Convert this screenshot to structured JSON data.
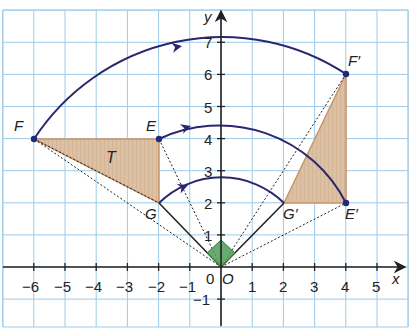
{
  "diagram": {
    "type": "rotation-figure",
    "axes": {
      "x_label": "x",
      "y_label": "y",
      "x_ticks": [
        "−6",
        "−5",
        "−4",
        "−3",
        "−2",
        "−1",
        "1",
        "2",
        "3",
        "4",
        "5"
      ],
      "y_ticks": [
        "1",
        "2",
        "3",
        "4",
        "5",
        "6",
        "7"
      ],
      "y_neg_tick": "−1",
      "origin_label": "0",
      "xlim": [
        -6.9,
        6
      ],
      "ylim": [
        -1.9,
        8.2
      ]
    },
    "points": {
      "F": {
        "label": "F",
        "x": -6,
        "y": 4
      },
      "E": {
        "label": "E",
        "x": -2,
        "y": 4
      },
      "G": {
        "label": "G",
        "x": -2,
        "y": 2
      },
      "F_prime": {
        "label": "F′",
        "x": 4,
        "y": 6
      },
      "E_prime": {
        "label": "E′",
        "x": 4,
        "y": 2
      },
      "G_prime": {
        "label": "G′",
        "x": 2,
        "y": 2
      },
      "O": {
        "label": "O",
        "x": 0,
        "y": 0
      }
    },
    "shape_label": "T",
    "colors": {
      "grid": "#9fcbe8",
      "shape_fill": "#d9b99a",
      "shape_stroke": "#c8956a",
      "arc": "#2a2670",
      "arrow": "#2a2670",
      "angle_marker": "#3f9a4a",
      "axis": "#222222"
    }
  }
}
